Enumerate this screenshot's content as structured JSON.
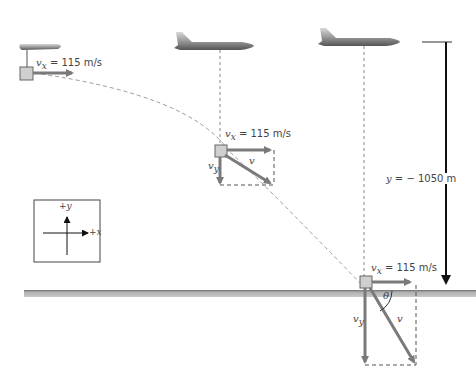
{
  "diagram": {
    "initial": {
      "vx_symbol": "v",
      "vx_sub": "x",
      "vx_value": "= 115 m/s"
    },
    "middle": {
      "vx_symbol": "v",
      "vx_sub": "x",
      "vx_value": "= 115 m/s",
      "vy_symbol": "v",
      "vy_sub": "y",
      "v_symbol": "v"
    },
    "ground": {
      "vx_symbol": "v",
      "vx_sub": "x",
      "vx_value": "= 115 m/s",
      "vy_symbol": "v",
      "vy_sub": "y",
      "v_symbol": "v",
      "angle_symbol": "θ"
    },
    "height_label": {
      "prefix": "y",
      "value": "= − 1050 m"
    },
    "axes_inset": {
      "y_label": "+y",
      "x_label": "+x"
    },
    "colors": {
      "vector": "#7a7a7a",
      "trajectory": "#9a9a9a",
      "ground": "#9c9c9c",
      "package": "#cfcfcf",
      "height_arrow": "#111111"
    }
  }
}
